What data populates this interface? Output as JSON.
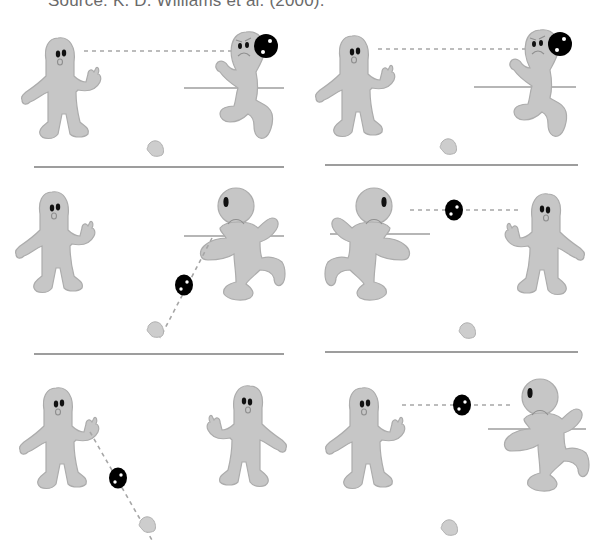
{
  "caption": "Source: K. D. Williams et al. (2000).",
  "figure": {
    "layout": {
      "rows": 3,
      "columns": 2
    },
    "panels": [
      {
        "id": 1,
        "row": 1,
        "col": 1,
        "ball_holder": "right-player",
        "throw_direction": "right-to-left-player (dashed trajectory)"
      },
      {
        "id": 2,
        "row": 1,
        "col": 2,
        "ball_holder": "right-player",
        "throw_direction": "right-to-left-player (dashed trajectory)"
      },
      {
        "id": 3,
        "row": 2,
        "col": 1,
        "ball_holder": "in-flight",
        "throw_direction": "right-player-to-participant"
      },
      {
        "id": 4,
        "row": 2,
        "col": 2,
        "ball_holder": "in-flight",
        "throw_direction": "left-player-to-right-player"
      },
      {
        "id": 5,
        "row": 3,
        "col": 1,
        "ball_holder": "in-flight",
        "throw_direction": "left-player-to-participant"
      },
      {
        "id": 6,
        "row": 3,
        "col": 2,
        "ball_holder": "in-flight",
        "throw_direction": "left-player-to-right-player"
      }
    ],
    "colors": {
      "figure_fill": "#c6c6c6",
      "figure_outline": "#acacac",
      "ball": "#000000",
      "divider": "#7d7d7d",
      "trajectory": "#a6a6a6"
    }
  }
}
